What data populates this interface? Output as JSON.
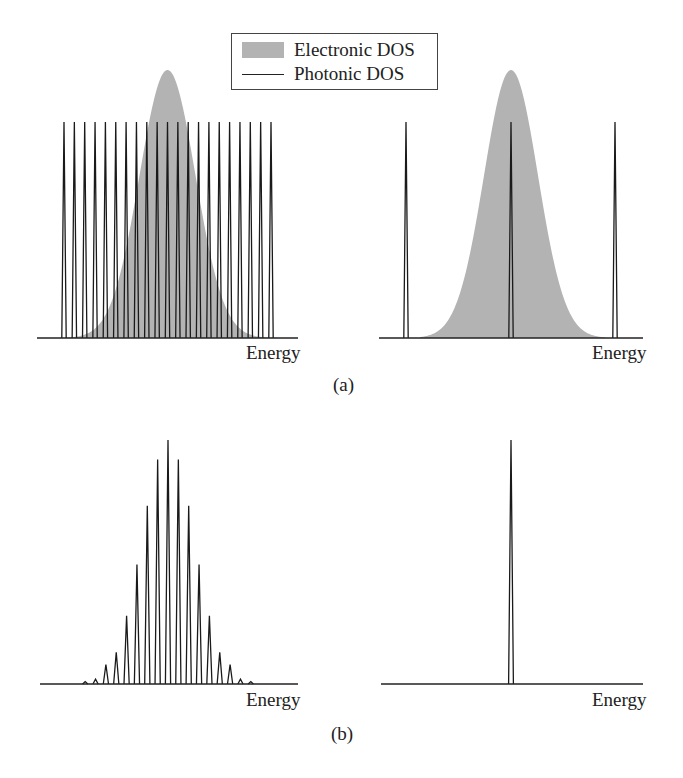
{
  "legend": {
    "items": [
      {
        "label": "Electronic DOS",
        "style": "filled",
        "color": "#b3b3b3"
      },
      {
        "label": "Photonic DOS",
        "style": "line",
        "color": "#222222"
      }
    ]
  },
  "panels": {
    "a": {
      "caption": "(a)",
      "left_xlabel": "Energy",
      "right_xlabel": "Energy"
    },
    "b": {
      "caption": "(b)",
      "left_xlabel": "Energy",
      "right_xlabel": "Energy"
    }
  },
  "chart_data": [
    {
      "type": "line",
      "panel": "(a) left",
      "title": "",
      "xlabel": "Energy",
      "ylabel": "",
      "series": [
        {
          "name": "Electronic DOS",
          "shape": "gaussian",
          "center_index": 10,
          "relative_height": 1.24,
          "relative_width_modes": 6.6
        },
        {
          "name": "Photonic DOS",
          "shape": "comb",
          "mode_count": 21,
          "relative_heights": [
            1,
            1,
            1,
            1,
            1,
            1,
            1,
            1,
            1,
            1,
            1,
            1,
            1,
            1,
            1,
            1,
            1,
            1,
            1,
            1,
            1
          ]
        }
      ]
    },
    {
      "type": "line",
      "panel": "(a) right",
      "title": "",
      "xlabel": "Energy",
      "ylabel": "",
      "series": [
        {
          "name": "Electronic DOS",
          "shape": "gaussian",
          "center_index": 1,
          "relative_height": 1.24,
          "relative_width_modes": 1.35
        },
        {
          "name": "Photonic DOS",
          "shape": "comb",
          "mode_count": 3,
          "relative_heights": [
            1,
            1,
            1
          ]
        }
      ]
    },
    {
      "type": "line",
      "panel": "(b) left",
      "title": "",
      "xlabel": "Energy",
      "ylabel": "",
      "series": [
        {
          "name": "Emission spectrum",
          "shape": "comb",
          "x_mode_index": [
            -8,
            -7,
            -6,
            -5,
            -4,
            -3,
            -2,
            -1,
            0,
            1,
            2,
            3,
            4,
            5,
            6,
            7,
            8
          ],
          "relative_heights": [
            0.01,
            0.02,
            0.08,
            0.13,
            0.28,
            0.49,
            0.73,
            0.92,
            1.0,
            0.92,
            0.73,
            0.49,
            0.28,
            0.13,
            0.08,
            0.02,
            0.01
          ]
        }
      ]
    },
    {
      "type": "line",
      "panel": "(b) right",
      "title": "",
      "xlabel": "Energy",
      "ylabel": "",
      "series": [
        {
          "name": "Emission spectrum",
          "shape": "comb",
          "x_mode_index": [
            0
          ],
          "relative_heights": [
            1.0
          ]
        }
      ]
    }
  ]
}
